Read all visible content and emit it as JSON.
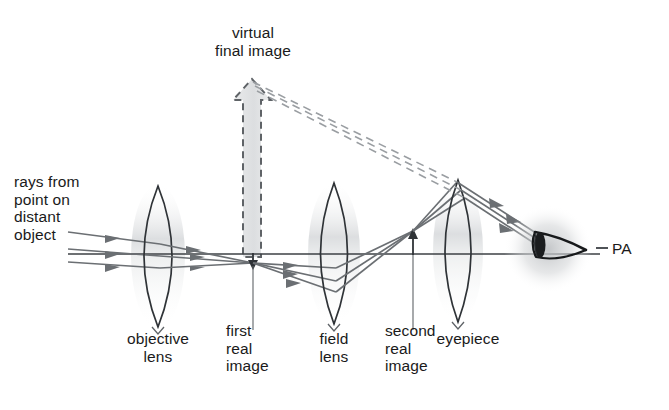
{
  "diagram": {
    "title_text": "Compound telescope / terrestrial eyepiece ray diagram",
    "background": "#ffffff",
    "ink": "#1a1a1a",
    "ray_color": "#6b6f73",
    "dash_color": "#8d9196",
    "shade_color": "#d7d9da",
    "labels": {
      "virtual_final_image": "virtual\nfinal image",
      "rays_from_point": "rays from\npoint on\ndistant\nobject",
      "objective_lens": "objective\nlens",
      "first_real_image": "first\nreal\nimage",
      "field_lens": "field\nlens",
      "second_real_image": "second\nreal\nimage",
      "eyepiece": "eyepiece",
      "principal_axis": "PA"
    },
    "elements": {
      "objective_lens": {
        "cx": 158,
        "top_y": 186,
        "bottom_y": 327,
        "half_width": 26
      },
      "field_lens": {
        "cx": 334,
        "top_y": 183,
        "bottom_y": 324,
        "half_width": 25
      },
      "eyepiece_lens": {
        "cx": 458,
        "top_y": 180,
        "bottom_y": 322,
        "half_width": 24
      },
      "first_real_image": {
        "x": 253,
        "tip_y": 268,
        "base_y": 253
      },
      "second_real_image": {
        "x": 413,
        "tip_y": 229,
        "base_y": 255
      },
      "virtual_final_image": {
        "x": 252,
        "tip_y": 79,
        "base_y": 256,
        "shaft_half_width": 9,
        "head_half_width": 19
      },
      "principal_axis": {
        "y": 254,
        "x_start": 68,
        "x_end": 600
      },
      "eye": {
        "cx": 548,
        "cy": 248
      }
    }
  }
}
